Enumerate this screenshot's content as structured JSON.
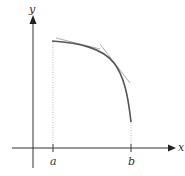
{
  "diagram": {
    "axes": {
      "x_label": "x",
      "y_label": "y"
    },
    "ticks": [
      {
        "label": "a"
      },
      {
        "label": "b"
      }
    ],
    "elements": {
      "curve": "concave-down-curve-from-a-to-b",
      "tangents": [
        "tangent-segment-upper",
        "tangent-segment-lower"
      ],
      "guides": [
        "dotted-line-at-a",
        "dotted-line-at-b"
      ]
    },
    "colors": {
      "axis": "#333333",
      "curve": "#555555",
      "tangent": "#999999",
      "guide": "#aaaaaa"
    }
  }
}
